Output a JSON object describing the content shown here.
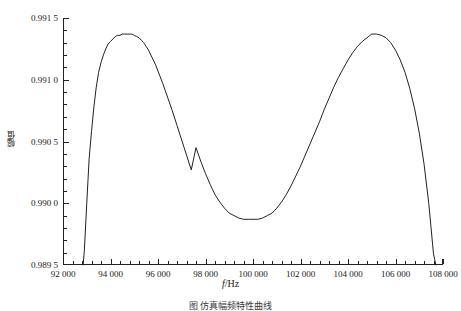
{
  "figure": {
    "background": "#ffffff",
    "line_color": "#222222",
    "axis_color": "#222222"
  },
  "axis_titles": {
    "x": "f/Hz",
    "x_italic_part": "f",
    "x_rest": "/Hz",
    "y": "幅值"
  },
  "caption": "图  仿真幅频特性曲线",
  "y_ticks": [
    {
      "value": 0.9915,
      "label": "0.991 5"
    },
    {
      "value": 0.991,
      "label": "0.991 0"
    },
    {
      "value": 0.9905,
      "label": "0.990 5"
    },
    {
      "value": 0.99,
      "label": "0.990 0"
    },
    {
      "value": 0.9895,
      "label": "0.989 5"
    }
  ],
  "x_ticks": [
    {
      "value": 92000,
      "label": "92 000"
    },
    {
      "value": 94000,
      "label": "94 000"
    },
    {
      "value": 96000,
      "label": "96 000"
    },
    {
      "value": 98000,
      "label": "98 000"
    },
    {
      "value": 100000,
      "label": "100 000"
    },
    {
      "value": 102000,
      "label": "102 000"
    },
    {
      "value": 104000,
      "label": "104 000"
    },
    {
      "value": 106000,
      "label": "106 000"
    },
    {
      "value": 108000,
      "label": "108 000"
    }
  ],
  "chart_data": {
    "type": "line",
    "title": "",
    "subtitle": "",
    "xlabel": "f/Hz",
    "ylabel": "幅值",
    "xlim": [
      92000,
      108000
    ],
    "ylim": [
      0.9895,
      0.9915
    ],
    "grid": false,
    "legend": null,
    "minor_ticks_per_interval": 4,
    "series": [
      {
        "name": "幅频特性",
        "x": [
          92850,
          92900,
          93000,
          93100,
          93200,
          93300,
          93400,
          93500,
          93600,
          93700,
          93800,
          93900,
          94000,
          94100,
          94200,
          94300,
          94400,
          94500,
          94600,
          94700,
          94800,
          94900,
          95000,
          95100,
          95200,
          95300,
          95400,
          95500,
          95600,
          95700,
          95800,
          95900,
          96000,
          96200,
          96400,
          96600,
          96800,
          97000,
          97200,
          97400,
          97600,
          97800,
          98000,
          98200,
          98400,
          98600,
          98800,
          99000,
          99200,
          99400,
          99600,
          99800,
          100000,
          100200,
          100400,
          100600,
          100800,
          101000,
          101200,
          101400,
          101600,
          101800,
          102000,
          102200,
          102400,
          102600,
          102800,
          103000,
          103200,
          103400,
          103600,
          103800,
          104000,
          104200,
          104400,
          104600,
          104800,
          105000,
          105100,
          105200,
          105400,
          105600,
          105800,
          106000,
          106200,
          106400,
          106600,
          106800,
          107000,
          107200,
          107400,
          107600,
          107700
        ],
        "y": [
          0.9895,
          0.98962,
          0.99,
          0.99036,
          0.99058,
          0.99078,
          0.99094,
          0.99106,
          0.99114,
          0.9912,
          0.99125,
          0.99129,
          0.99131,
          0.99133,
          0.99135,
          0.99136,
          0.99136,
          0.99137,
          0.99137,
          0.99137,
          0.99137,
          0.99137,
          0.99136,
          0.99135,
          0.99134,
          0.99132,
          0.9913,
          0.99127,
          0.99124,
          0.9912,
          0.99116,
          0.99112,
          0.99107,
          0.99097,
          0.99086,
          0.99075,
          0.99063,
          0.99051,
          0.99039,
          0.99027,
          0.99045,
          0.99034,
          0.99024,
          0.99015,
          0.99007,
          0.99001,
          0.98996,
          0.98992,
          0.9899,
          0.98988,
          0.98987,
          0.98987,
          0.98987,
          0.98987,
          0.98988,
          0.9899,
          0.98992,
          0.98996,
          0.99001,
          0.99007,
          0.99014,
          0.99022,
          0.9903,
          0.99039,
          0.99048,
          0.99057,
          0.99066,
          0.99076,
          0.99085,
          0.99094,
          0.99102,
          0.99109,
          0.99116,
          0.99122,
          0.99127,
          0.99131,
          0.99134,
          0.99137,
          0.99137,
          0.99137,
          0.99136,
          0.99134,
          0.9913,
          0.99124,
          0.99116,
          0.99106,
          0.99093,
          0.99077,
          0.99057,
          0.99032,
          0.99,
          0.98959,
          0.9895
        ]
      }
    ],
    "peaks": [
      {
        "x": 94900,
        "y": 0.99137
      },
      {
        "x": 105100,
        "y": 0.99137
      }
    ],
    "valley": {
      "x": 100000,
      "y": 0.98987
    }
  }
}
